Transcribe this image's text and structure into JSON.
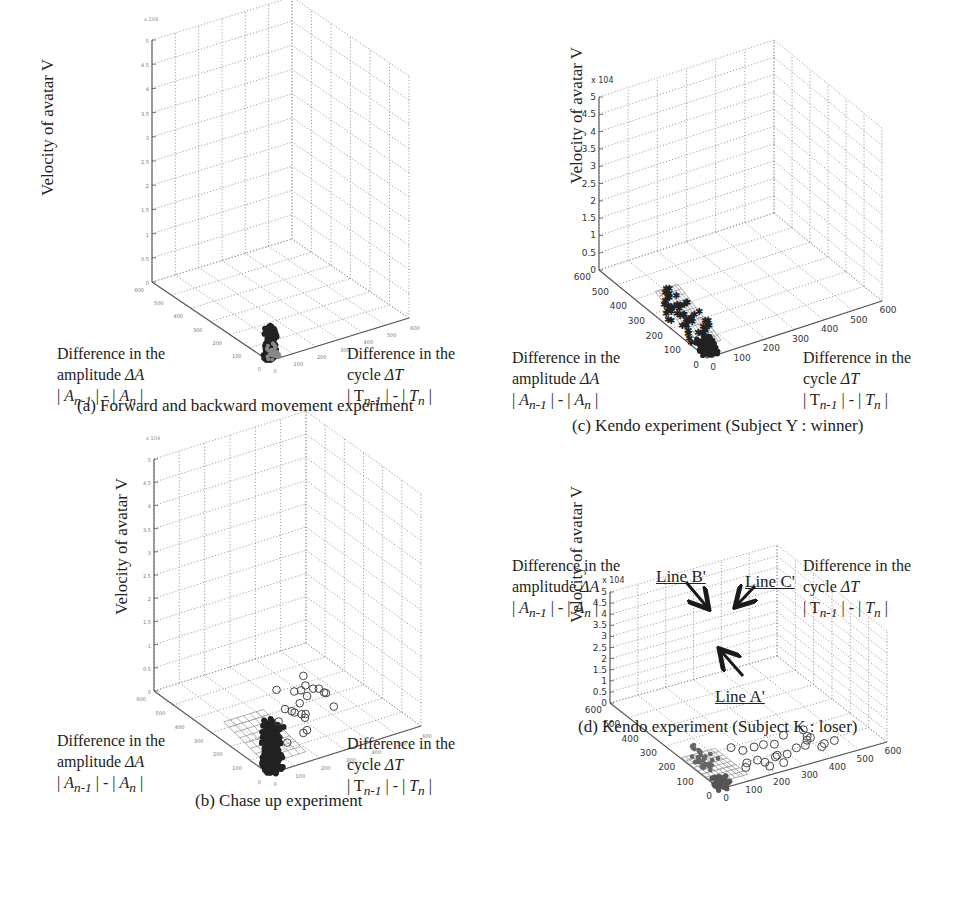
{
  "figure": {
    "common": {
      "z_label": "Velocity of  avatar  V",
      "a_label_lines": [
        "Difference in the",
        "amplitude ΔA",
        "| A_n-1 | - | A_n |"
      ],
      "t_label_lines": [
        "Difference in the",
        "cycle ΔT",
        "| T_n-1 | - | T_n |"
      ],
      "z_exponent": "x 10^4"
    },
    "panels": [
      {
        "id": "a",
        "caption": "(a) Forward and backward movement experiment"
      },
      {
        "id": "b",
        "caption": "(b) Chase up experiment"
      },
      {
        "id": "c",
        "caption": "(c) Kendo experiment (Subject Y : winner)"
      },
      {
        "id": "d",
        "caption": "(d) Kendo experiment (Subject K : loser)",
        "annotations": [
          "Line A'",
          "Line B'",
          "Line C'"
        ]
      }
    ]
  },
  "chart_data": [
    {
      "type": "scatter",
      "subtype": "3d_scatter",
      "title": "(a) Forward and backward movement experiment",
      "xlabel": "Difference in the cycle ΔT |T_n-1| - |T_n|",
      "ylabel": "Difference in the amplitude ΔA |A_n-1| - |A_n|",
      "zlabel": "Velocity of avatar V",
      "xlim": [
        0,
        600
      ],
      "ylim": [
        0,
        600
      ],
      "zlim": [
        0,
        50000
      ],
      "z_ticks": [
        0,
        0.5,
        1,
        1.5,
        2,
        2.5,
        3,
        3.5,
        4,
        4.5,
        5
      ],
      "z_multiplier": "x 10^4",
      "x_ticks": [
        0,
        100,
        200,
        300,
        400,
        500,
        600
      ],
      "y_ticks": [
        0,
        100,
        200,
        300,
        400,
        500,
        600
      ],
      "grid": true,
      "description": "Dense cluster of filled points near origin (ΔT≈0-20, ΔA≈0-20) extending up in V to about 0.6e4"
    },
    {
      "type": "scatter",
      "subtype": "3d_scatter",
      "title": "(b) Chase up experiment",
      "xlabel": "Difference in the cycle ΔT |T_n-1| - |T_n|",
      "ylabel": "Difference in the amplitude ΔA |A_n-1| - |A_n|",
      "zlabel": "Velocity of avatar V",
      "xlim": [
        0,
        600
      ],
      "ylim": [
        0,
        600
      ],
      "zlim": [
        0,
        50000
      ],
      "z_ticks": [
        0,
        0.5,
        1,
        1.5,
        2,
        2.5,
        3,
        3.5,
        4,
        4.5,
        5
      ],
      "z_multiplier": "x 10^4",
      "grid": true,
      "series": [
        {
          "name": "filled points",
          "description": "dense cluster near origin, V up to ~0.9e4, with mesh surface"
        },
        {
          "name": "open circles",
          "description": "scattered points at ΔT≈150-400, V≈0.5-1.5e4"
        }
      ]
    },
    {
      "type": "scatter",
      "subtype": "3d_scatter",
      "title": "(c) Kendo experiment (Subject Y : winner)",
      "xlabel": "Difference in the cycle ΔT |T_n-1| - |T_n|",
      "ylabel": "Difference in the amplitude ΔA |A_n-1| - |A_n|",
      "zlabel": "Velocity of avatar V",
      "xlim": [
        0,
        600
      ],
      "ylim": [
        0,
        600
      ],
      "zlim": [
        0,
        50000
      ],
      "z_ticks": [
        0,
        0.5,
        1,
        1.5,
        2,
        2.5,
        3,
        3.5,
        4,
        4.5,
        5
      ],
      "z_multiplier": "x 10^4",
      "x_ticks": [
        0,
        100,
        200,
        300,
        400,
        500,
        600
      ],
      "y_ticks": [
        0,
        100,
        200,
        300,
        400,
        500,
        600
      ],
      "grid": true,
      "description": "Star markers along a tilted mesh plane rising from origin to V≈1e4, concentrated near ΔT≈0-100"
    },
    {
      "type": "scatter",
      "subtype": "3d_scatter",
      "title": "(d) Kendo experiment (Subject K : loser)",
      "xlabel": "Difference in the cycle ΔT |T_n-1| - |T_n|",
      "ylabel": "Difference in the amplitude ΔA |A_n-1| - |A_n|",
      "zlabel": "Velocity of avatar V",
      "xlim": [
        0,
        600
      ],
      "ylim": [
        0,
        600
      ],
      "zlim": [
        0,
        50000
      ],
      "z_ticks": [
        0,
        0.5,
        1,
        1.5,
        2,
        2.5,
        3,
        3.5,
        4,
        4.5,
        5
      ],
      "z_multiplier": "x 10^4",
      "x_ticks": [
        0,
        100,
        200,
        300,
        400,
        500,
        600
      ],
      "y_ticks": [
        0,
        100,
        200,
        300,
        400,
        500,
        600
      ],
      "grid": true,
      "annotations": [
        "Line A'",
        "Line B'",
        "Line C'"
      ],
      "series": [
        {
          "name": "filled points",
          "description": "two branches (Line B', Line C') rising from origin cluster (Line A')"
        },
        {
          "name": "open circles",
          "description": "points at ΔT≈100-500, low V"
        }
      ]
    }
  ]
}
